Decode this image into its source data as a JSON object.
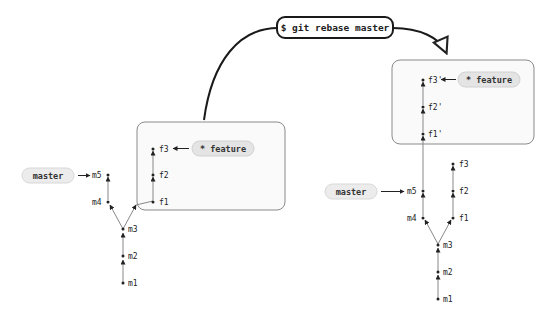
{
  "command": {
    "label": "$ git rebase master"
  },
  "before": {
    "branch_feature": "* feature",
    "branch_master": "master",
    "commits": {
      "m1": "m1",
      "m2": "m2",
      "m3": "m3",
      "m4": "m4",
      "m5": "m5",
      "f1": "f1",
      "f2": "f2",
      "f3": "f3"
    }
  },
  "after": {
    "branch_feature": "* feature",
    "branch_master": "master",
    "commits": {
      "m1": "m1",
      "m2": "m2",
      "m3": "m3",
      "m4": "m4",
      "m5": "m5",
      "f1": "f1",
      "f2": "f2",
      "f3": "f3",
      "f1p": "f1'",
      "f2p": "f2'",
      "f3p": "f3'"
    }
  },
  "colors": {
    "pill_fill": "#e4e4e4",
    "box_stroke": "#8a8a8a",
    "box_fill": "#fafafa",
    "edge": "#888888",
    "curve": "#1a1a1a"
  }
}
